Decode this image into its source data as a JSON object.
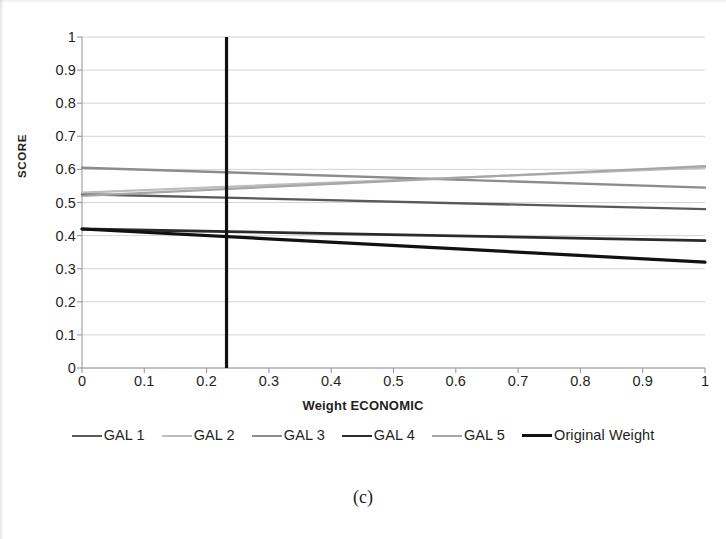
{
  "caption": "(c)",
  "axes": {
    "y_title": "SCORE",
    "x_title": "Weight ECONOMIC",
    "y_ticks": [
      "0",
      "0.1",
      "0.2",
      "0.3",
      "0.4",
      "0.5",
      "0.6",
      "0.7",
      "0.8",
      "0.9",
      "1"
    ],
    "x_ticks": [
      "0",
      "0.1",
      "0.2",
      "0.3",
      "0.4",
      "0.5",
      "0.6",
      "0.7",
      "0.8",
      "0.9",
      "1"
    ]
  },
  "legend": {
    "items": [
      {
        "label": "GAL 1",
        "color": "#5a5a5a",
        "width": 2.4
      },
      {
        "label": "GAL 2",
        "color": "#bdbdbd",
        "width": 2.2
      },
      {
        "label": "GAL 3",
        "color": "#8c8c8c",
        "width": 2.4
      },
      {
        "label": "GAL 4",
        "color": "#2b2b2b",
        "width": 2.8
      },
      {
        "label": "GAL 5",
        "color": "#a6a6a6",
        "width": 2.2
      },
      {
        "label": "Original Weight",
        "color": "#111111",
        "width": 3.2
      }
    ]
  },
  "chart_data": {
    "type": "line",
    "title": "",
    "xlabel": "Weight ECONOMIC",
    "ylabel": "SCORE",
    "xlim": [
      0,
      1
    ],
    "ylim": [
      0,
      1
    ],
    "grid": true,
    "legend_position": "bottom",
    "x": [
      0,
      1
    ],
    "series": [
      {
        "name": "GAL 1",
        "color": "#5a5a5a",
        "width": 2.4,
        "values": [
          0.525,
          0.48
        ]
      },
      {
        "name": "GAL 2",
        "color": "#bdbdbd",
        "width": 2.2,
        "values": [
          0.53,
          0.605
        ]
      },
      {
        "name": "GAL 3",
        "color": "#8c8c8c",
        "width": 2.4,
        "values": [
          0.605,
          0.545
        ]
      },
      {
        "name": "GAL 4",
        "color": "#2b2b2b",
        "width": 2.8,
        "values": [
          0.42,
          0.385
        ]
      },
      {
        "name": "GAL 5",
        "color": "#a6a6a6",
        "width": 2.2,
        "values": [
          0.52,
          0.61
        ]
      },
      {
        "name": "Original Weight",
        "color": "#111111",
        "width": 3.2,
        "values": [
          0.42,
          0.32
        ]
      }
    ],
    "annotations": [
      {
        "name": "current-weight-marker",
        "type": "vline",
        "x": 0.232,
        "color": "#111111",
        "width": 3.2,
        "y_from": 0,
        "y_to": 1
      }
    ]
  }
}
